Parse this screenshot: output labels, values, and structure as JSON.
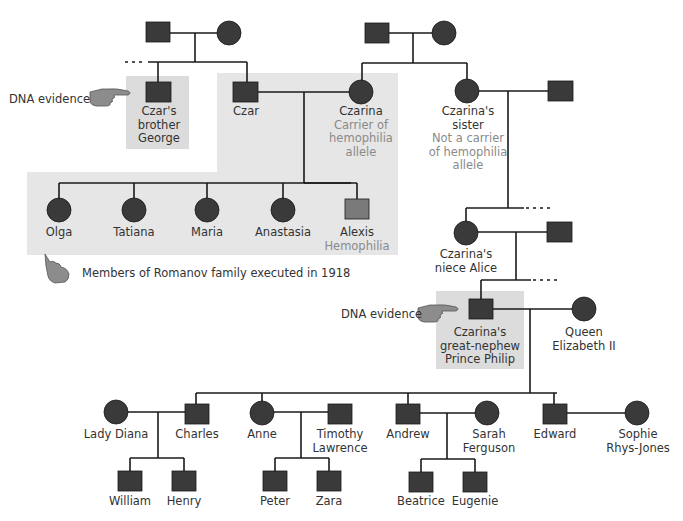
{
  "figure": {
    "colors": {
      "symbol_fill": "#3a3a3a",
      "affected_fill": "#7a7a7a",
      "shade_box": "#e6e6e6",
      "line": "#1a1a1a",
      "sub_text": "#8a8a8a",
      "text": "#333333"
    },
    "annotations": {
      "dna_evidence_top": "DNA evidence",
      "dna_evidence_philip": "DNA evidence",
      "romanov_note": "Members of Romanov family executed in 1918"
    },
    "people": {
      "czars_brother": [
        "Czar's",
        "brother",
        "George"
      ],
      "czar": "Czar",
      "czarina": "Czarina",
      "czarina_note": [
        "Carrier of",
        "hemophilia",
        "allele"
      ],
      "czarinas_sister": [
        "Czarina's",
        "sister"
      ],
      "sister_note": [
        "Not a carrier",
        "of hemophilia",
        "allele"
      ],
      "children": [
        "Olga",
        "Tatiana",
        "Maria",
        "Anastasia",
        "Alexis"
      ],
      "alexis_note": "Hemophilia",
      "niece_alice": [
        "Czarina's",
        "niece Alice"
      ],
      "prince_philip": [
        "Czarina's",
        "great-nephew",
        "Prince Philip"
      ],
      "queen": [
        "Queen",
        "Elizabeth II"
      ],
      "royal_gen": {
        "lady_diana": "Lady Diana",
        "charles": "Charles",
        "anne": "Anne",
        "timothy": [
          "Timothy",
          "Lawrence"
        ],
        "andrew": "Andrew",
        "sarah": [
          "Sarah",
          "Ferguson"
        ],
        "edward": "Edward",
        "sophie": [
          "Sophie",
          "Rhys-Jones"
        ]
      },
      "grandchildren": {
        "william": "William",
        "henry": "Henry",
        "peter": "Peter",
        "zara": "Zara",
        "beatrice": "Beatrice",
        "eugenie": "Eugenie"
      }
    }
  }
}
